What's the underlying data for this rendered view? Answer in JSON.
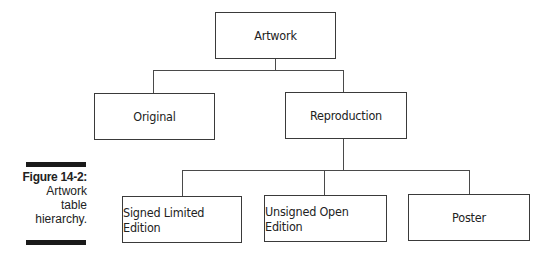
{
  "diagram": {
    "title": "Artwork table hierarchy",
    "nodes": {
      "root": {
        "label": "Artwork"
      },
      "original": {
        "label": "Original"
      },
      "reproduction": {
        "label": "Reproduction"
      },
      "signed": {
        "label": "Signed Limited Edition"
      },
      "unsigned": {
        "label": "Unsigned Open Edition"
      },
      "poster": {
        "label": "Poster"
      }
    },
    "edges": [
      [
        "Artwork",
        "Original"
      ],
      [
        "Artwork",
        "Reproduction"
      ],
      [
        "Reproduction",
        "Signed Limited Edition"
      ],
      [
        "Reproduction",
        "Unsigned Open Edition"
      ],
      [
        "Reproduction",
        "Poster"
      ]
    ]
  },
  "caption": {
    "figure_label": "Figure 14-2:",
    "line1": "Artwork",
    "line2": "table",
    "line3": "hierarchy."
  }
}
